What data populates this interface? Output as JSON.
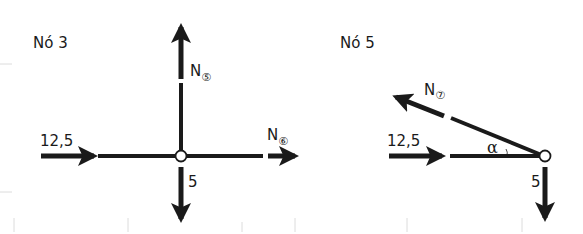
{
  "diagrams": [
    {
      "title": "Nó 3",
      "forces": [
        {
          "name": "applied-horizontal",
          "label": "12,5",
          "direction": "right"
        },
        {
          "name": "member-5",
          "label": "N",
          "member": "5",
          "member_glyph": "⑤",
          "direction": "up"
        },
        {
          "name": "member-6",
          "label": "N",
          "member": "6",
          "member_glyph": "⑥",
          "direction": "right"
        },
        {
          "name": "applied-vertical",
          "label": "5",
          "direction": "down"
        }
      ]
    },
    {
      "title": "Nó 5",
      "forces": [
        {
          "name": "applied-horizontal",
          "label": "12,5",
          "direction": "right"
        },
        {
          "name": "member-7",
          "label": "N",
          "member": "7",
          "member_glyph": "⑦",
          "direction": "up-left"
        },
        {
          "name": "applied-vertical",
          "label": "5",
          "direction": "down"
        }
      ],
      "angle_label": "α"
    }
  ],
  "colors": {
    "ink": "#1a1a1a",
    "faint": "#dcdcdc",
    "background": "#ffffff"
  }
}
